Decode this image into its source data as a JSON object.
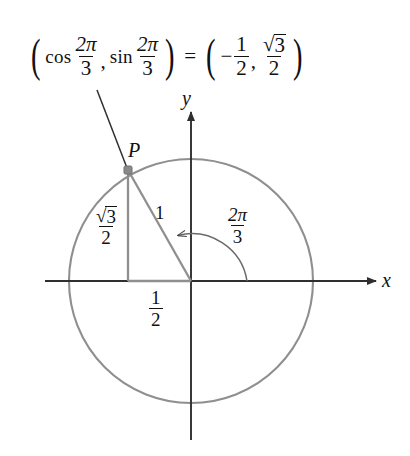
{
  "figure": {
    "background": "#ffffff",
    "stroke_gray": "#8a8a8a",
    "stroke_dark": "#3a3a3a",
    "text_color": "#111111"
  },
  "equation": {
    "open_paren": "(",
    "cos_fn": "cos",
    "cos_arg_num": "2π",
    "cos_arg_den": "3",
    "comma": ",",
    "sin_fn": "sin",
    "sin_arg_num": "2π",
    "sin_arg_den": "3",
    "close_paren": ")",
    "equals": "=",
    "rhs_open_paren": "(",
    "rhs_minus": "−",
    "rhs_x_num": "1",
    "rhs_x_den": "2",
    "rhs_comma": ",",
    "rhs_y_num": "3",
    "rhs_y_den": "2",
    "rhs_close_paren": ")",
    "full_text": "(cos 2π/3, sin 2π/3) = (−1/2, √3/2)"
  },
  "axes": {
    "x_label": "x",
    "y_label": "y",
    "origin": {
      "x": 191,
      "y": 281
    },
    "x_start": 45,
    "x_end": 378,
    "y_top": 110,
    "y_bottom": 440
  },
  "circle": {
    "center_x": 191,
    "center_y": 281,
    "radius": 122
  },
  "point": {
    "label": "P",
    "x": 128,
    "y": 170,
    "cos_value": "-1/2",
    "sin_value": "√3/2"
  },
  "triangle": {
    "hypotenuse_label": "1",
    "vertical_leg_num": "3",
    "vertical_leg_den": "2",
    "horizontal_leg_num": "1",
    "horizontal_leg_den": "2"
  },
  "angle": {
    "num": "2π",
    "den": "3",
    "radians": 2.0944,
    "degrees": 120,
    "arc_radius": 56,
    "direction": "counterclockwise"
  }
}
